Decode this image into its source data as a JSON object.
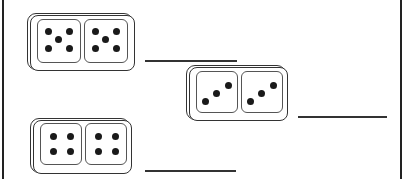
{
  "worksheet": {
    "type": "domino addition",
    "dominoes": [
      {
        "left_pips": 5,
        "right_pips": 5
      },
      {
        "left_pips": 3,
        "right_pips": 3
      },
      {
        "left_pips": 4,
        "right_pips": 4
      }
    ],
    "answer_lines": [
      {
        "value": ""
      },
      {
        "value": ""
      },
      {
        "value": ""
      }
    ]
  },
  "colors": {
    "ink": "#222222",
    "background": "#ffffff"
  }
}
